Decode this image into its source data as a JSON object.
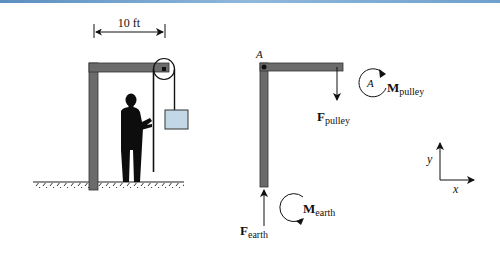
{
  "colors": {
    "top_bar": "#6f9fcc",
    "frame_fill": "#6b6b6b",
    "frame_stroke": "#333333",
    "box_fill": "#c3d8e6",
    "ink": "#111111"
  },
  "left_figure": {
    "dimension_label": "10 ft",
    "description": "Person pulling rope over a pulley on an L-shaped frame lifting a box"
  },
  "free_body": {
    "point_label": "A",
    "f_pulley": {
      "main": "F",
      "sub": "pulley"
    },
    "m_pulley": {
      "main": "M",
      "sub": "pulley",
      "inner_label": "A"
    },
    "f_earth": {
      "main": "F",
      "sub": "earth"
    },
    "m_earth": {
      "main": "M",
      "sub": "earth"
    }
  },
  "axes": {
    "x_label": "x",
    "y_label": "y"
  }
}
